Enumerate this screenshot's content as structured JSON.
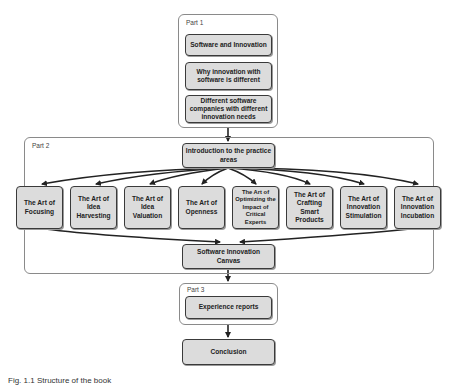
{
  "diagram": {
    "colors": {
      "node_fill": "#dcdcdc",
      "node_border": "#3a3a3a",
      "group_border": "#8a8a8a",
      "edge": "#222222"
    },
    "parts": [
      {
        "label": "Part 1",
        "nodes": [
          "Software and Innovation",
          "Why innovation with software is different",
          "Different software companies with different innovation needs"
        ]
      },
      {
        "label": "Part 2",
        "intro": "Introduction to the practice areas",
        "practice_areas": [
          "The Art of Focusing",
          "The Art of Idea Harvesting",
          "The Art of Idea Valuation",
          "The Art of Openness",
          "The Art of Optimizing the Impact of Critical Experts",
          "The Art of Crafting Smart Products",
          "The Art of Innovation Stimulation",
          "The Art of Innovation Incubation"
        ],
        "outro": "Software Innovation Canvas"
      },
      {
        "label": "Part 3",
        "nodes": [
          "Experience reports"
        ]
      }
    ],
    "final_node": "Conclusion",
    "caption": "Fig. 1.1 Structure of the book"
  }
}
